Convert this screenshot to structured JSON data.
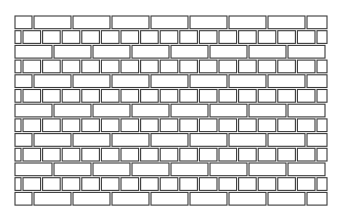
{
  "image": {
    "subject": "brick wall line drawing",
    "background": "#ffffff",
    "stroke": "#3a3a3a"
  },
  "wall": {
    "left": 15,
    "right": 327,
    "top": 16,
    "row_height": 14.7,
    "rows": [
      {
        "type": "large",
        "offset": 19
      },
      {
        "type": "small",
        "offset": 8
      },
      {
        "type": "large",
        "offset": 0
      },
      {
        "type": "small",
        "offset": 8
      },
      {
        "type": "large",
        "offset": 19
      },
      {
        "type": "small",
        "offset": 8
      },
      {
        "type": "large",
        "offset": 0
      },
      {
        "type": "small",
        "offset": 8
      },
      {
        "type": "large",
        "offset": 19
      },
      {
        "type": "small",
        "offset": 8
      },
      {
        "type": "large",
        "offset": 0
      },
      {
        "type": "small",
        "offset": 8
      },
      {
        "type": "large",
        "offset": 19
      }
    ],
    "large_brick_width": 39,
    "small_brick_width": 19.6,
    "gap": 2
  }
}
